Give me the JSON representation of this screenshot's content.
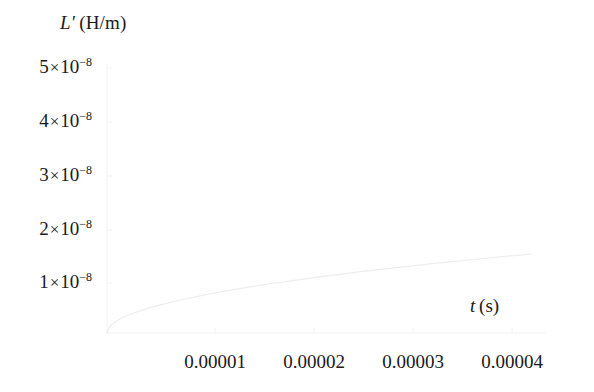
{
  "figure": {
    "background": "#ffffff",
    "curve_color": "#ededf0",
    "axis_color": "#f2f2f4",
    "text_color": "#1a1a1a"
  },
  "axes": {
    "ylabel_symbol": "L",
    "ylabel_prime": "′",
    "ylabel_units": "(H/m)",
    "ylabel_full": "L′ (H/m)",
    "xlabel_symbol": "t",
    "xlabel_units": "(s)",
    "xlabel_full": "t (s)"
  },
  "yticks": [
    {
      "label_mantissa": "5",
      "label_exp": "−8",
      "value": 5e-08,
      "y_px": 68
    },
    {
      "label_mantissa": "4",
      "label_exp": "−8",
      "value": 4e-08,
      "y_px": 122
    },
    {
      "label_mantissa": "3",
      "label_exp": "−8",
      "value": 3e-08,
      "y_px": 176
    },
    {
      "label_mantissa": "2",
      "label_exp": "−8",
      "value": 2e-08,
      "y_px": 230
    },
    {
      "label_mantissa": "1",
      "label_exp": "−8",
      "value": 1e-08,
      "y_px": 283
    }
  ],
  "xticks": [
    {
      "label": "0.00001",
      "value": 1e-05,
      "x_px": 215
    },
    {
      "label": "0.00002",
      "value": 2e-05,
      "x_px": 314
    },
    {
      "label": "0.00003",
      "value": 3e-05,
      "x_px": 413
    },
    {
      "label": "0.00004",
      "value": 4e-05,
      "x_px": 512
    }
  ],
  "chart_data": {
    "type": "line",
    "title": "",
    "xlabel": "t (s)",
    "ylabel": "L′ (H/m)",
    "xlim": [
      0,
      4.35e-05
    ],
    "ylim": [
      0,
      5.4e-08
    ],
    "grid": false,
    "legend": null,
    "series": [
      {
        "name": "L′(t)",
        "color": "#ededf0",
        "linewidth": 1,
        "x": [
          0,
          2e-07,
          5e-07,
          1e-06,
          1.6e-06,
          2.4e-06,
          3.2e-06,
          4.2e-06,
          5.2e-06,
          6.4e-06,
          7.6e-06,
          9e-06,
          1e-05,
          1.2e-05,
          1.4e-05,
          1.6e-05,
          1.8e-05,
          2e-05,
          2.2e-05,
          2.4e-05,
          2.6e-05,
          2.8e-05,
          3e-05,
          3.2e-05,
          3.4e-05,
          3.6e-05,
          3.8e-05,
          4e-05,
          4.2e-05
        ],
        "y": [
          0.0,
          1.1e-09,
          1.74e-09,
          2.46e-09,
          3.11e-09,
          3.81e-09,
          4.4e-09,
          5.04e-09,
          5.61e-09,
          6.22e-09,
          6.78e-09,
          7.37e-09,
          7.78e-09,
          8.52e-09,
          9.2e-09,
          9.83e-09,
          1.042e-08,
          1.098e-08,
          1.151e-08,
          1.202e-08,
          1.251e-08,
          1.298e-08,
          1.343e-08,
          1.386e-08,
          1.429e-08,
          1.47e-08,
          1.51e-08,
          1.548e-08,
          1.585e-08
        ]
      }
    ]
  }
}
